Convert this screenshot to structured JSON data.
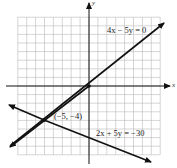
{
  "chart_data": {
    "type": "line",
    "title": "",
    "xlabel": "x",
    "ylabel": "y",
    "xlim": [
      -8,
      8
    ],
    "ylim": [
      -8,
      8
    ],
    "grid": true,
    "series": [
      {
        "name": "4x − 5y = 0",
        "equation": "4x - 5y = 0",
        "slope": 0.8,
        "intercept": 0,
        "x": [
          -9,
          8.4
        ],
        "y": [
          -7.2,
          6.72
        ]
      },
      {
        "name": "2x + 5y = −30",
        "equation": "2x + 5y = -30",
        "slope": -0.4,
        "intercept": -6,
        "x": [
          -9,
          7
        ],
        "y": [
          -2.4,
          -8.8
        ]
      }
    ],
    "annotations": [
      {
        "text": "(−5, −4)",
        "x": -5,
        "y": -4,
        "type": "intersection-point"
      }
    ]
  },
  "labels": {
    "line1": "4x − 5y = 0",
    "line2": "2x + 5y = −30",
    "point": "(−5, −4)",
    "x_axis": "x",
    "y_axis": "y"
  }
}
